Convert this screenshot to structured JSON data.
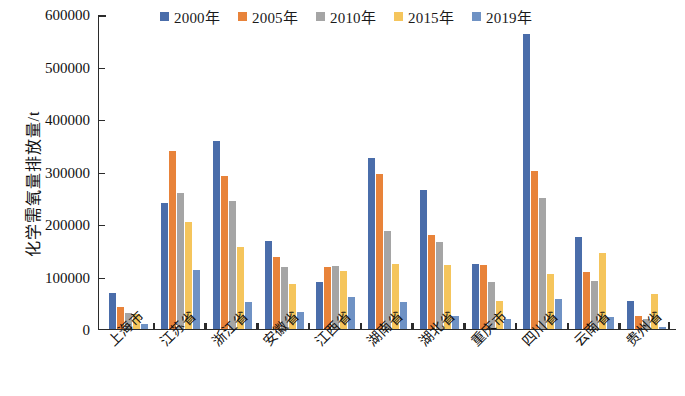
{
  "chart_data": {
    "type": "bar",
    "title": "",
    "xlabel": "",
    "ylabel": "化学需氧量排放量/t",
    "ylim": [
      0,
      600000
    ],
    "ytick_step": 100000,
    "ytick_labels": [
      "600000",
      "500000",
      "400000",
      "300000",
      "200000",
      "100000",
      "0"
    ],
    "grid": false,
    "legend_position": "top-center",
    "categories": [
      "上海市",
      "江苏省",
      "浙江省",
      "安徽省",
      "江西省",
      "湖南省",
      "湖北省",
      "重庆市",
      "四川省",
      "云南省",
      "贵州省"
    ],
    "series": [
      {
        "name": "2000年",
        "color": "#4a6daa",
        "values": [
          69000,
          240000,
          358000,
          168000,
          90000,
          326000,
          265000,
          124000,
          562000,
          176000,
          53000
        ]
      },
      {
        "name": "2005年",
        "color": "#e8833a",
        "values": [
          42000,
          339000,
          291000,
          137000,
          118000,
          295000,
          179000,
          122000,
          301000,
          109000,
          25000
        ]
      },
      {
        "name": "2010年",
        "color": "#a5a5a5",
        "values": [
          30000,
          259000,
          244000,
          118000,
          120000,
          187000,
          166000,
          90000,
          249000,
          92000,
          19000
        ]
      },
      {
        "name": "2015年",
        "color": "#f5c55c",
        "values": [
          28000,
          204000,
          156000,
          86000,
          110000,
          124000,
          122000,
          53000,
          104000,
          145000,
          67000
        ]
      },
      {
        "name": "2019年",
        "color": "#6f92c4",
        "values": [
          9000,
          112000,
          51000,
          32000,
          61000,
          51000,
          25000,
          19000,
          57000,
          23000,
          3000
        ]
      }
    ]
  }
}
